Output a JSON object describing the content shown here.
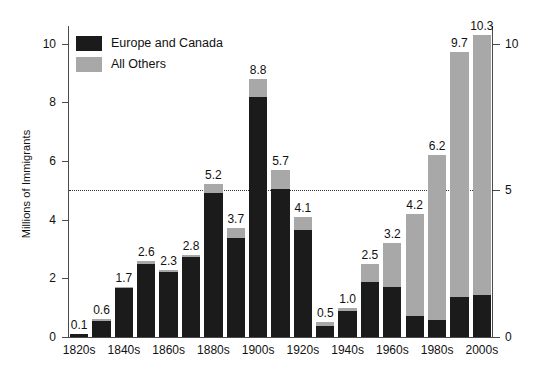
{
  "chart_data": {
    "type": "bar",
    "title": "",
    "subtitle": "",
    "xlabel": "",
    "ylabel": "Millions of Immigrants",
    "ylim": [
      0,
      10.6
    ],
    "y_ticks_left": [
      "0",
      "2",
      "4",
      "6",
      "8",
      "10"
    ],
    "y_ticks_left_values": [
      0,
      2,
      4,
      6,
      8,
      10
    ],
    "y_ticks_right": [
      "0",
      "5",
      "10"
    ],
    "y_ticks_right_values": [
      0,
      5,
      10
    ],
    "grid": false,
    "reference_line": {
      "value": 5,
      "style": "dotted"
    },
    "stacked": true,
    "legend_position": "top-left",
    "categories": [
      "1820s",
      "1830s",
      "1840s",
      "1850s",
      "1860s",
      "1870s",
      "1880s",
      "1890s",
      "1900s",
      "1910s",
      "1920s",
      "1930s",
      "1940s",
      "1950s",
      "1960s",
      "1970s",
      "1980s",
      "1990s",
      "2000s"
    ],
    "visible_tick_labels": [
      "1820s",
      "1840s",
      "1860s",
      "1880s",
      "1900s",
      "1920s",
      "1940s",
      "1960s",
      "1980s",
      "2000s"
    ],
    "series": [
      {
        "name": "Europe and Canada",
        "color": "#1b1b1b",
        "values": [
          0.1,
          0.55,
          1.68,
          2.5,
          2.23,
          2.72,
          4.92,
          3.38,
          8.18,
          5.03,
          3.65,
          0.38,
          0.88,
          1.88,
          1.72,
          0.72,
          0.58,
          1.37,
          1.43
        ]
      },
      {
        "name": "All Others",
        "color": "#a8a8a8",
        "values": [
          0.0,
          0.05,
          0.02,
          0.1,
          0.07,
          0.08,
          0.28,
          0.32,
          0.62,
          0.67,
          0.45,
          0.12,
          0.12,
          0.62,
          1.48,
          3.48,
          5.62,
          8.33,
          8.87
        ]
      }
    ],
    "totals": [
      0.1,
      0.6,
      1.7,
      2.6,
      2.3,
      2.8,
      5.2,
      3.7,
      8.8,
      5.7,
      4.1,
      0.5,
      1.0,
      2.5,
      3.2,
      4.2,
      6.2,
      9.7,
      10.3
    ],
    "data_labels": [
      "0.1",
      "0.6",
      "1.7",
      "2.6",
      "2.3",
      "2.8",
      "5.2",
      "3.7",
      "8.8",
      "5.7",
      "4.1",
      "0.5",
      "1.0",
      "2.5",
      "3.2",
      "4.2",
      "6.2",
      "9.7",
      "10.3"
    ]
  },
  "legend": {
    "items": [
      {
        "label": "Europe and Canada",
        "color": "#1b1b1b"
      },
      {
        "label": "All Others",
        "color": "#a8a8a8"
      }
    ]
  },
  "axes": {
    "y_title": "Millions of Immigrants"
  }
}
